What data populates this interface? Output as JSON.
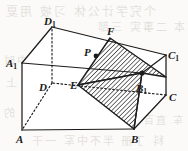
{
  "figure": {
    "kind": "solid-geometry-diagram",
    "canvas": {
      "width": 188,
      "height": 151
    },
    "stroke_color": "#1c1c1c",
    "hatch_color": "#1c1c1c",
    "face_fill": "#ffffff",
    "background_color": "#fbfaf8"
  },
  "vertices": [
    {
      "id": "A",
      "label": "A",
      "sub": "",
      "x": 22,
      "y": 130,
      "label_x": 16,
      "label_y": 134,
      "hidden": false
    },
    {
      "id": "B",
      "label": "B",
      "sub": "",
      "x": 134,
      "y": 129,
      "label_x": 131,
      "label_y": 134,
      "hidden": false
    },
    {
      "id": "C",
      "label": "C",
      "sub": "",
      "x": 166,
      "y": 95,
      "label_x": 169,
      "label_y": 92,
      "hidden": false
    },
    {
      "id": "D",
      "label": "D",
      "sub": "",
      "x": 52,
      "y": 83,
      "label_x": 39,
      "label_y": 82,
      "hidden": true
    },
    {
      "id": "A1",
      "label": "A",
      "sub": "1",
      "x": 22,
      "y": 63,
      "label_x": 6,
      "label_y": 58,
      "hidden": false
    },
    {
      "id": "B1",
      "label": "B",
      "sub": "1",
      "x": 142,
      "y": 73,
      "label_x": 136,
      "label_y": 83,
      "hidden": false
    },
    {
      "id": "C1",
      "label": "C",
      "sub": "1",
      "x": 166,
      "y": 55,
      "label_x": 168,
      "label_y": 50,
      "hidden": false
    },
    {
      "id": "D1",
      "label": "D",
      "sub": "1",
      "x": 52,
      "y": 27,
      "label_x": 44,
      "label_y": 16,
      "hidden": false
    }
  ],
  "marked_points": [
    {
      "id": "E",
      "label": "E",
      "sub": "",
      "x": 78,
      "y": 85,
      "label_x": 70,
      "label_y": 80,
      "dot": false
    },
    {
      "id": "F",
      "label": "F",
      "sub": "",
      "x": 110,
      "y": 38,
      "label_x": 107,
      "label_y": 26,
      "dot": false
    },
    {
      "id": "P",
      "label": "P",
      "sub": "",
      "x": 96,
      "y": 56,
      "label_x": 84,
      "label_y": 47,
      "dot": true
    }
  ],
  "edges": [
    {
      "from": "A",
      "to": "B",
      "style": "solid"
    },
    {
      "from": "B",
      "to": "C",
      "style": "solid"
    },
    {
      "from": "C",
      "to": "D",
      "style": "dashed"
    },
    {
      "from": "D",
      "to": "A",
      "style": "dashed"
    },
    {
      "from": "A1",
      "to": "B1",
      "style": "solid"
    },
    {
      "from": "B1",
      "to": "C1",
      "style": "solid"
    },
    {
      "from": "C1",
      "to": "D1",
      "style": "solid"
    },
    {
      "from": "D1",
      "to": "A1",
      "style": "solid"
    },
    {
      "from": "A",
      "to": "A1",
      "style": "solid"
    },
    {
      "from": "B",
      "to": "B1",
      "style": "solid"
    },
    {
      "from": "C",
      "to": "C1",
      "style": "solid"
    },
    {
      "from": "D",
      "to": "D1",
      "style": "dashed"
    }
  ],
  "section": {
    "name": "hatched-cross-section",
    "polygon_upper": "78,85 110,38 166,77 142,73",
    "polygon_lower": "78,85 142,73 134,129",
    "hatch_angle_deg": 45,
    "hatch_spacing_px": 3.2
  },
  "bleed_text": {
    "note": "faint show-through text from reverse of scanned page",
    "rows": [
      {
        "text": "个究学计公休 习坡 用夏",
        "x": 4,
        "y": 2,
        "size": 12
      },
      {
        "text": "司本 二事实 三部",
        "x": 96,
        "y": 18,
        "size": 11
      },
      {
        "text": "问的 中时",
        "x": 2,
        "y": 52,
        "size": 11
      },
      {
        "text": "第 样本 上",
        "x": 4,
        "y": 74,
        "size": 11
      },
      {
        "text": "题问门市 革变 的",
        "x": 2,
        "y": 104,
        "size": 11
      },
      {
        "text": "车 直百不中",
        "x": 118,
        "y": 112,
        "size": 10
      },
      {
        "text": "科 丁册 半不中军 一干",
        "x": 30,
        "y": 132,
        "size": 11
      }
    ]
  }
}
